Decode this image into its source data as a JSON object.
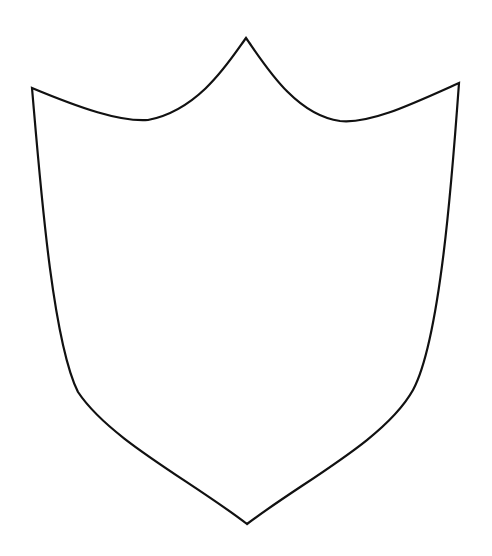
{
  "figure": {
    "stroke_color": "#111111",
    "fill_color": "#ffffff",
    "background": "#ffffff"
  }
}
